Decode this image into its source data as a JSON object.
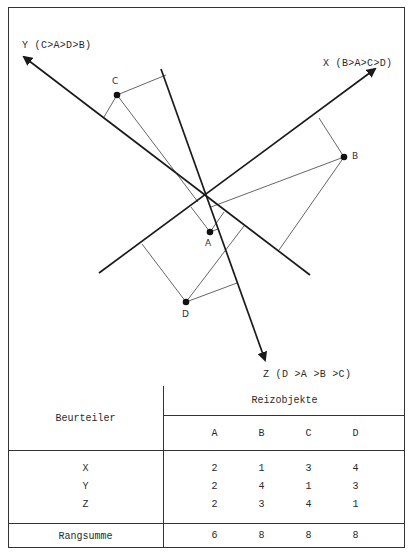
{
  "diagram": {
    "axes": [
      {
        "name": "X",
        "label": "X (B>A>C>D)",
        "order": [
          "B",
          "A",
          "C",
          "D"
        ]
      },
      {
        "name": "Y",
        "label": "Y (C>A>D>B)",
        "order": [
          "C",
          "A",
          "D",
          "B"
        ]
      },
      {
        "name": "Z",
        "label": "Z (D >A >B >C)",
        "order": [
          "D",
          "A",
          "B",
          "C"
        ]
      }
    ],
    "points": [
      {
        "name": "A",
        "label": "A"
      },
      {
        "name": "B",
        "label": "B"
      },
      {
        "name": "C",
        "label": "C"
      },
      {
        "name": "D",
        "label": "D"
      }
    ],
    "colors": {
      "line": "#2a2a2a",
      "projection": "#555555",
      "point": "#111111"
    }
  },
  "table": {
    "row_header": "Beurteiler",
    "col_group_header": "Reizobjekte",
    "columns": [
      "A",
      "B",
      "C",
      "D"
    ],
    "rows": [
      {
        "rater": "X",
        "ranks": [
          "2",
          "1",
          "3",
          "4"
        ]
      },
      {
        "rater": "Y",
        "ranks": [
          "2",
          "4",
          "1",
          "3"
        ]
      },
      {
        "rater": "Z",
        "ranks": [
          "2",
          "3",
          "4",
          "1"
        ]
      }
    ],
    "sum_label": "Rangsumme",
    "sums": [
      "6",
      "8",
      "8",
      "8"
    ]
  }
}
